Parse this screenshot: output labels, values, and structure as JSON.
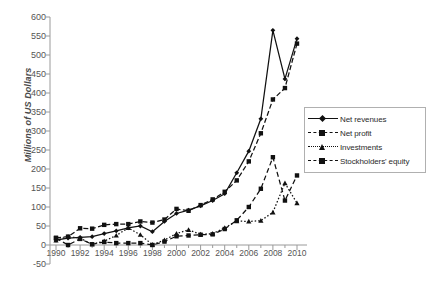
{
  "chart_data": {
    "type": "line",
    "title": "",
    "xlabel": "",
    "ylabel": "Millions of US Dollars",
    "ylim": [
      -50,
      600
    ],
    "ytick_step": 50,
    "xlim": [
      1990,
      2010
    ],
    "grid": false,
    "legend_position": "right",
    "x": [
      1990,
      1991,
      1992,
      1993,
      1994,
      1995,
      1996,
      1997,
      1998,
      1999,
      2000,
      2001,
      2002,
      2003,
      2004,
      2005,
      2006,
      2007,
      2008,
      2009,
      2010
    ],
    "ytick_labels": [
      "600",
      "550",
      "500",
      "450",
      "400",
      "350",
      "300",
      "250",
      "200",
      "150",
      "100",
      "50",
      "0",
      "-50"
    ],
    "xtick_labels": [
      "1990",
      "1992",
      "1994",
      "1996",
      "1998",
      "2000",
      "2002",
      "2004",
      "2006",
      "2008",
      "2010"
    ],
    "series": [
      {
        "name": "Net revenues",
        "line_style": "solid",
        "marker": "diamond",
        "color": "#111111",
        "values": [
          13,
          18,
          20,
          22,
          30,
          37,
          45,
          50,
          35,
          62,
          83,
          92,
          103,
          117,
          135,
          190,
          247,
          332,
          565,
          437,
          543
        ]
      },
      {
        "name": "Net profit",
        "line_style": "dashed",
        "marker": "square",
        "color": "#111111",
        "values": [
          18,
          0,
          16,
          2,
          8,
          5,
          5,
          5,
          0,
          9,
          23,
          25,
          27,
          28,
          42,
          65,
          100,
          148,
          231,
          117,
          183
        ]
      },
      {
        "name": "Investments",
        "line_style": "dotted",
        "marker": "triangle",
        "color": "#111111",
        "values": [
          12,
          22,
          18,
          2,
          10,
          25,
          45,
          27,
          1,
          13,
          30,
          40,
          28,
          30,
          45,
          63,
          62,
          64,
          86,
          163,
          110
        ]
      },
      {
        "name": "Stockholders' equity",
        "line_style": "dashdot",
        "marker": "square",
        "color": "#111111",
        "values": [
          19,
          22,
          44,
          43,
          53,
          55,
          55,
          62,
          59,
          67,
          95,
          90,
          105,
          120,
          140,
          170,
          220,
          294,
          383,
          413,
          530
        ]
      }
    ]
  },
  "axis": {
    "title": "Millions of US Dollars"
  }
}
